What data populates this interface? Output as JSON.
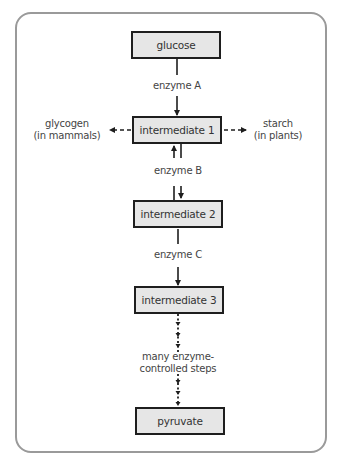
{
  "diagram": {
    "title": "",
    "nodes": [
      {
        "id": "glucose",
        "label": "glucose"
      },
      {
        "id": "intermediate1",
        "label": "intermediate 1"
      },
      {
        "id": "intermediate2",
        "label": "intermediate 2"
      },
      {
        "id": "intermediate3",
        "label": "intermediate 3"
      },
      {
        "id": "pyruvate",
        "label": "pyruvate"
      }
    ],
    "side_products": {
      "left": {
        "line1": "glycogen",
        "line2": "(in mammals)"
      },
      "right": {
        "line1": "starch",
        "line2": "(in plants)"
      }
    },
    "edges": [
      {
        "from": "glucose",
        "to": "intermediate1",
        "label": "enzyme A",
        "style": "solid",
        "direction": "forward"
      },
      {
        "from": "intermediate1",
        "to": "intermediate2",
        "label": "enzyme B",
        "style": "solid",
        "direction": "reversible"
      },
      {
        "from": "intermediate2",
        "to": "intermediate3",
        "label": "enzyme C",
        "style": "solid",
        "direction": "forward"
      },
      {
        "from": "intermediate3",
        "to": "pyruvate",
        "label_line1": "many enzyme-",
        "label_line2": "controlled steps",
        "style": "dotted",
        "direction": "forward"
      },
      {
        "from": "intermediate1",
        "to": "glycogen",
        "style": "dashed",
        "direction": "forward"
      },
      {
        "from": "intermediate1",
        "to": "starch",
        "style": "dashed",
        "direction": "forward"
      }
    ],
    "colors": {
      "node_fill": "#e6e6e6",
      "node_border": "#1e1e1e",
      "frame_border": "#9a9a9a",
      "text": "#333333"
    }
  }
}
